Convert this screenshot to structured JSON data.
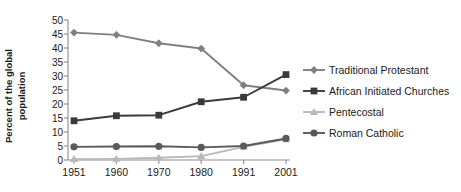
{
  "chart_data": {
    "type": "line",
    "title": "",
    "subtitle": "",
    "xlabel": "",
    "ylabel": "Percent of the global population",
    "categories": [
      "1951",
      "1960",
      "1970",
      "1980",
      "1991",
      "2001"
    ],
    "ylim": [
      0,
      50
    ],
    "yticks": [
      "0",
      "5",
      "10",
      "15",
      "20",
      "25",
      "30",
      "35",
      "40",
      "45",
      "50"
    ],
    "ytick_values": [
      0,
      5,
      10,
      15,
      20,
      25,
      30,
      35,
      40,
      45,
      50
    ],
    "grid": false,
    "legend_position": "right",
    "series": [
      {
        "name": "Traditional Protestant",
        "values": [
          45.5,
          44.7,
          41.7,
          39.8,
          26.7,
          24.8
        ],
        "color": "#808080",
        "marker": "diamond"
      },
      {
        "name": "African Initiated Churches",
        "values": [
          14.0,
          15.8,
          16.0,
          20.8,
          22.4,
          30.5
        ],
        "color": "#3a3a3a",
        "marker": "square"
      },
      {
        "name": "Pentecostal",
        "values": [
          0.3,
          0.4,
          0.8,
          1.4,
          4.7,
          7.4
        ],
        "color": "#b8b8b8",
        "marker": "triangle"
      },
      {
        "name": "Roman Catholic",
        "values": [
          4.7,
          4.8,
          4.9,
          4.5,
          5.0,
          7.7
        ],
        "color": "#5a5a5a",
        "marker": "circle"
      }
    ]
  },
  "legend": {
    "items": [
      {
        "label": "Traditional Protestant"
      },
      {
        "label": "African Initiated Churches"
      },
      {
        "label": "Pentecostal"
      },
      {
        "label": "Roman Catholic"
      }
    ]
  },
  "axes": {
    "y_axis_label_line1": "Percent of the global",
    "y_axis_label_line2": "population"
  }
}
